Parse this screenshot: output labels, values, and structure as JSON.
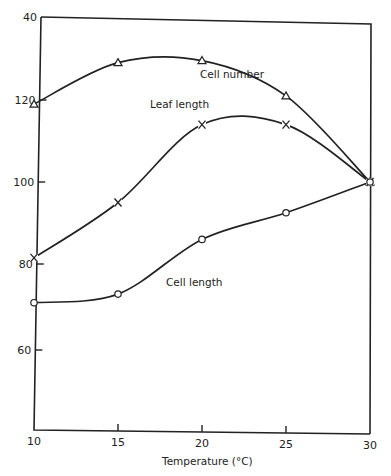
{
  "chart_data": {
    "type": "line",
    "title": "",
    "xlabel": "Temperature (°C)",
    "ylabel": "",
    "x": [
      10,
      15,
      20,
      25,
      30
    ],
    "xlim": [
      10,
      30
    ],
    "ylim": [
      40,
      140
    ],
    "x_ticks": [
      "10",
      "15",
      "20",
      "25",
      "30"
    ],
    "y_ticks": [
      "40",
      "60",
      "80",
      "100",
      "120"
    ],
    "y_tick_values": [
      140,
      60,
      80,
      100,
      120
    ],
    "grid": false,
    "legend": "inline labels",
    "series": [
      {
        "name": "Cell number",
        "marker": "triangle",
        "values": [
          119,
          129,
          129.5,
          121,
          100
        ]
      },
      {
        "name": "Leaf length",
        "marker": "x",
        "values": [
          81.5,
          95,
          114,
          114,
          100
        ]
      },
      {
        "name": "Cell length",
        "marker": "circle",
        "values": [
          71,
          73,
          86,
          92.5,
          100
        ]
      }
    ],
    "annotations": [
      "Cell number",
      "Leaf length",
      "Cell length"
    ]
  },
  "labels": {
    "xlabel": "Temperature (°C)",
    "cell_number": "Cell number",
    "leaf_length": "Leaf length",
    "cell_length": "Cell length"
  }
}
